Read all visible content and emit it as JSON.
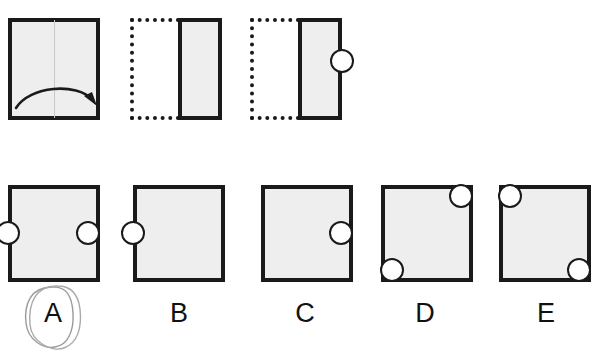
{
  "figure": {
    "type": "paper-folding-hole-punch-test",
    "title": "",
    "stimulus_row": {
      "panels": [
        {
          "id": "panel-1",
          "name": "unfolded-square-with-fold-arrow",
          "shape": "square",
          "fill_color": "#eeeeee",
          "stroke_color": "#1a1a1a",
          "fold_line": "vertical-center",
          "arrow": "curved-left-to-right",
          "holes": []
        },
        {
          "id": "panel-2",
          "name": "folded-once-right-half",
          "shape": "rectangle",
          "ghost_half": "left-dotted",
          "fill_color": "#eeeeee",
          "stroke_color": "#1a1a1a",
          "holes": []
        },
        {
          "id": "panel-3",
          "name": "folded-with-punch",
          "shape": "rectangle",
          "ghost_half": "left-dotted",
          "fill_color": "#eeeeee",
          "stroke_color": "#1a1a1a",
          "holes": [
            {
              "name": "punch-hole",
              "edge": "right",
              "position": "middle-right-edge"
            }
          ]
        }
      ]
    },
    "options_row": {
      "selected": "A",
      "selection_mark": "hand-drawn-ellipse",
      "options": [
        {
          "label": "A",
          "name": "option-a",
          "holes": [
            {
              "name": "hole-left-middle",
              "edge": "left",
              "position": "middle-left-edge"
            },
            {
              "name": "hole-right-middle",
              "edge": "right",
              "position": "middle-right-edge"
            }
          ]
        },
        {
          "label": "B",
          "name": "option-b",
          "holes": [
            {
              "name": "hole-left-middle",
              "edge": "left",
              "position": "middle-left-edge"
            }
          ]
        },
        {
          "label": "C",
          "name": "option-c",
          "holes": [
            {
              "name": "hole-right-middle",
              "edge": "right",
              "position": "middle-right-edge"
            }
          ]
        },
        {
          "label": "D",
          "name": "option-d",
          "holes": [
            {
              "name": "hole-top-right",
              "edge": "corner",
              "position": "top-right-corner"
            },
            {
              "name": "hole-bottom-left",
              "edge": "corner",
              "position": "bottom-left-corner"
            }
          ]
        },
        {
          "label": "E",
          "name": "option-e",
          "holes": [
            {
              "name": "hole-top-left",
              "edge": "corner",
              "position": "top-left-corner"
            },
            {
              "name": "hole-bottom-right",
              "edge": "corner",
              "position": "bottom-right-corner"
            }
          ]
        }
      ]
    },
    "colors": {
      "paper_fill": "#eeeeee",
      "outline": "#1a1a1a",
      "hole_fill": "#ffffff",
      "fold_line": "#c9c9c9",
      "pen_mark": "#999999",
      "background": "#ffffff"
    }
  }
}
